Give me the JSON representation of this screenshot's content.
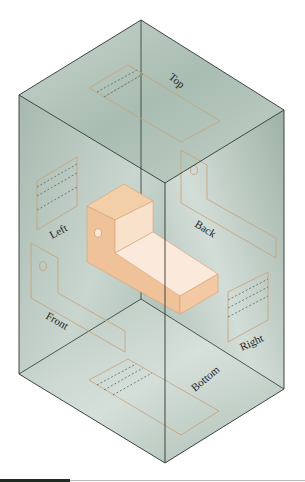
{
  "figure": {
    "colors": {
      "glass": "#b9c8c0",
      "glass_dark": "#8fa69b",
      "edge": "#2c3530",
      "object_light": "#f7dcc2",
      "object_mid": "#f0c49a",
      "object_dark": "#e8b283",
      "outline": "#c9a07a",
      "hidden_line": "#556a60"
    },
    "views": [
      {
        "name": "top",
        "label": "Top"
      },
      {
        "name": "left",
        "label": "Left"
      },
      {
        "name": "back",
        "label": "Back"
      },
      {
        "name": "front",
        "label": "Front"
      },
      {
        "name": "right",
        "label": "Right"
      },
      {
        "name": "bottom",
        "label": "Bottom"
      }
    ]
  }
}
